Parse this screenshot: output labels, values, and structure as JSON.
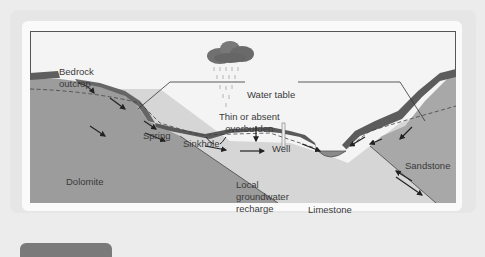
{
  "diagram": {
    "title": "",
    "labels": {
      "bedrock_outcrop_1": "Bedrock",
      "bedrock_outcrop_2": "outcrop",
      "water_table": "Water table",
      "thin_overburden_1": "Thin or absent",
      "thin_overburden_2": "overburden",
      "spring": "Spring",
      "sinkhole": "Sinkhole",
      "well": "Well",
      "dolomite": "Dolomite",
      "local_recharge_1": "Local",
      "local_recharge_2": "groundwater",
      "local_recharge_3": "recharge",
      "limestone": "Limestone",
      "sandstone": "Sandstone"
    },
    "colors": {
      "background": "#ececec",
      "card": "#fafafa",
      "dolomite": "#9a9a9a",
      "sandstone": "#a6a6a6",
      "limestone": "#d4d4d4",
      "overburden": "#5c5c5c",
      "cloud": "#6e6e6e",
      "tab": "#7a7a7a"
    }
  }
}
